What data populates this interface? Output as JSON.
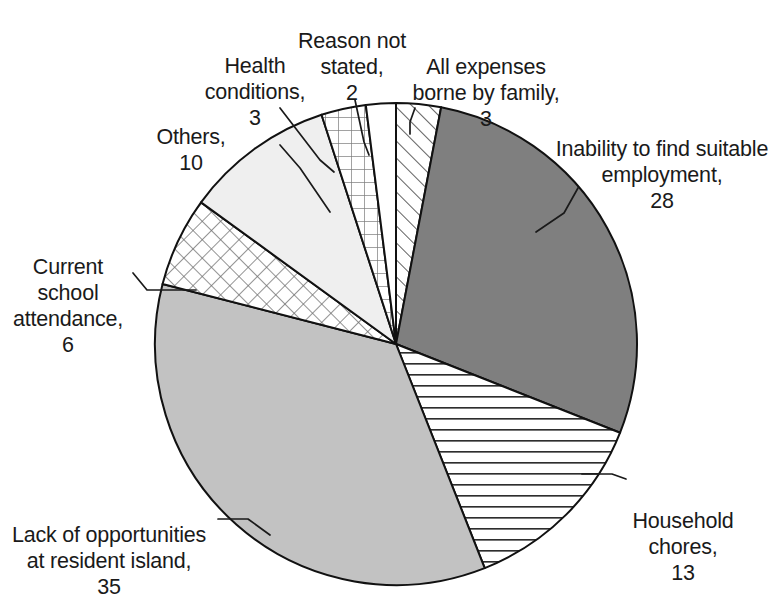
{
  "chart_data": {
    "type": "pie",
    "title": "",
    "subtitle": "",
    "xlabel": "",
    "ylabel": "",
    "legend_position": "none",
    "grid": false,
    "total": 100,
    "units": "percent",
    "start_angle_deg": 0,
    "direction": "clockwise",
    "categories": [
      "All expenses borne by family",
      "Inability to find suitable employment",
      "Household chores",
      "Lack of opportunities at resident island",
      "Current school attendance",
      "Others",
      "Health conditions",
      "Reason not stated"
    ],
    "values": [
      3,
      28,
      13,
      35,
      6,
      10,
      3,
      2
    ],
    "slices": [
      {
        "label": "All expenses borne by family",
        "value": 3,
        "text": "All expenses\nborne by family,",
        "value_text": "3",
        "fill": "diagonal-stripes",
        "color": "#ffffff"
      },
      {
        "label": "Inability to find suitable employment",
        "value": 28,
        "text": "Inability to find suitable\nemployment,",
        "value_text": "28",
        "fill": "solid",
        "color": "#7f7f7f"
      },
      {
        "label": "Household chores",
        "value": 13,
        "text": "Household\nchores,",
        "value_text": "13",
        "fill": "horizontal-lines",
        "color": "#ffffff"
      },
      {
        "label": "Lack of opportunities at resident island",
        "value": 35,
        "text": "Lack of opportunities\nat resident island,",
        "value_text": "35",
        "fill": "solid",
        "color": "#c2c2c2"
      },
      {
        "label": "Current school attendance",
        "value": 6,
        "text": "Current school\nattendance,",
        "value_text": "6",
        "fill": "diagonal-crosshatch",
        "color": "#ffffff"
      },
      {
        "label": "Others",
        "value": 10,
        "text": "Others,",
        "value_text": "10",
        "fill": "solid",
        "color": "#efefef"
      },
      {
        "label": "Health conditions",
        "value": 3,
        "text": "Health\nconditions,",
        "value_text": "3",
        "fill": "square-grid",
        "color": "#ffffff"
      },
      {
        "label": "Reason not stated",
        "value": 2,
        "text": "Reason not\nstated,",
        "value_text": "2",
        "fill": "blank",
        "color": "#ffffff"
      }
    ]
  },
  "labels": {
    "health_conditions": {
      "text": "Health\nconditions,",
      "value": "3"
    },
    "reason_not_stated": {
      "text": "Reason not\nstated,",
      "value": "2"
    },
    "all_expenses": {
      "text": "All expenses\nborne by family,",
      "value": "3"
    },
    "inability": {
      "text": "Inability to find suitable\nemployment,",
      "value": "28"
    },
    "others": {
      "text": "Others,",
      "value": "10"
    },
    "current_school": {
      "text": "Current school\nattendance,",
      "value": "6"
    },
    "lack_of_opportunities": {
      "text": "Lack of opportunities\nat resident island,",
      "value": "35"
    },
    "household_chores": {
      "text": "Household\nchores,",
      "value": "13"
    }
  }
}
